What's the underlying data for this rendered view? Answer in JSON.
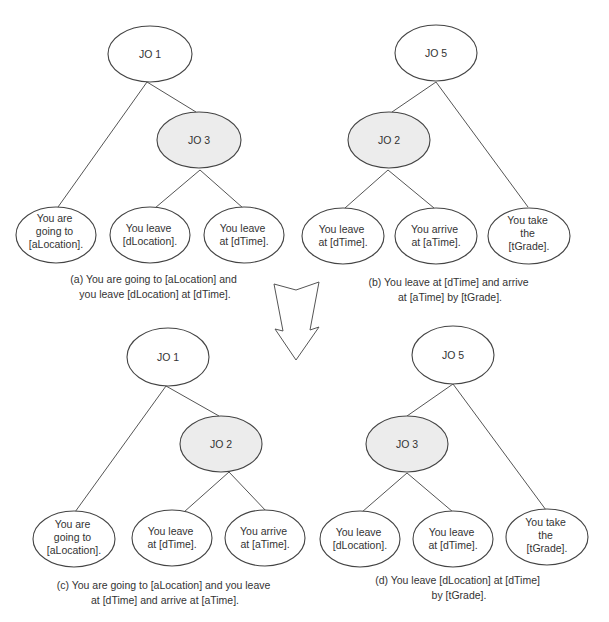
{
  "colors": {
    "shaded_node": "#ececec",
    "plain_node": "#ffffff",
    "stroke": "#444444"
  },
  "trees": [
    {
      "id": "a",
      "root": "JO 1",
      "internal": "JO 3",
      "leaves": [
        [
          "You are",
          "going to",
          "[aLocation]."
        ],
        [
          "You leave",
          "[dLocation]."
        ],
        [
          "You leave",
          "at [dTime]."
        ]
      ],
      "caption": [
        "(a) You are going to [aLocation] and",
        "you leave [dLocation] at [dTime]."
      ]
    },
    {
      "id": "b",
      "root": "JO 5",
      "internal": "JO 2",
      "leaves": [
        [
          "You leave",
          "at [dTime]."
        ],
        [
          "You arrive",
          "at [aTime]."
        ],
        [
          "You take",
          "the",
          "[tGrade]."
        ]
      ],
      "caption": [
        "(b) You leave  at [dTime] and arrive",
        "at [aTime] by [tGrade]."
      ]
    },
    {
      "id": "c",
      "root": "JO 1",
      "internal": "JO 2",
      "leaves": [
        [
          "You are",
          "going to",
          "[aLocation]."
        ],
        [
          "You leave",
          "at [dTime]."
        ],
        [
          "You arrive",
          "at [aTime]."
        ]
      ],
      "caption": [
        "(c) You are going to [aLocation] and you leave",
        "at [dTime] and arrive at [aTime]."
      ]
    },
    {
      "id": "d",
      "root": "JO 5",
      "internal": "JO 3",
      "leaves": [
        [
          "You leave",
          "[dLocation]."
        ],
        [
          "You leave",
          "at [dTime]."
        ],
        [
          "You take",
          "the",
          "[tGrade]."
        ]
      ],
      "caption": [
        "(d) You leave [dLocation] at [dTime]",
        "by [tGrade]."
      ]
    }
  ],
  "arrow": {
    "direction": "down",
    "meaning": "transformation"
  }
}
